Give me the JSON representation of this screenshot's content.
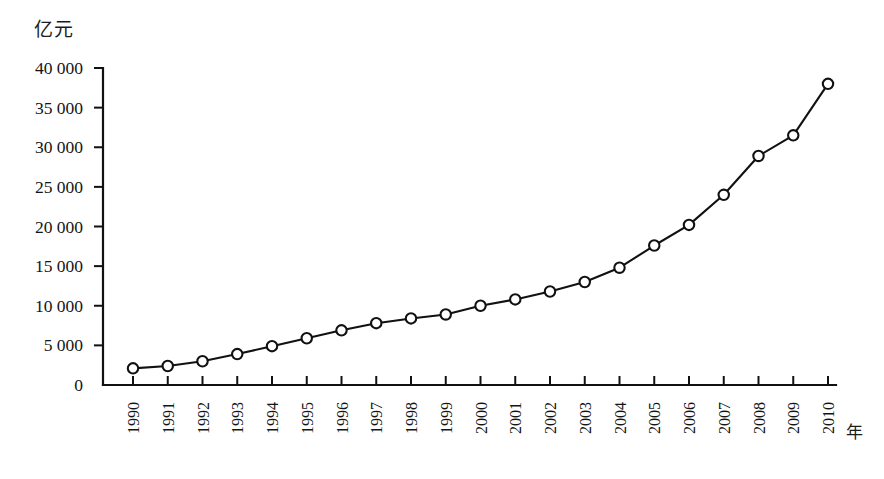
{
  "chart_data": {
    "type": "line",
    "title": "",
    "subtitle": "",
    "xlabel": "年",
    "ylabel": "亿元",
    "categories": [
      "1990",
      "1991",
      "1992",
      "1993",
      "1994",
      "1995",
      "1996",
      "1997",
      "1998",
      "1999",
      "2000",
      "2001",
      "2002",
      "2003",
      "2004",
      "2005",
      "2006",
      "2007",
      "2008",
      "2009",
      "2010"
    ],
    "values": [
      2100,
      2400,
      3000,
      3900,
      4900,
      5900,
      6900,
      7800,
      8400,
      8900,
      10000,
      10800,
      11800,
      13000,
      14800,
      17600,
      20200,
      24000,
      28900,
      31500,
      38000
    ],
    "series": [
      {
        "name": "",
        "values": [
          2100,
          2400,
          3000,
          3900,
          4900,
          5900,
          6900,
          7800,
          8400,
          8900,
          10000,
          10800,
          11800,
          13000,
          14800,
          17600,
          20200,
          24000,
          28900,
          31500,
          38000
        ]
      }
    ],
    "ylim": [
      0,
      40000
    ],
    "ytick_values": [
      0,
      5000,
      10000,
      15000,
      20000,
      25000,
      30000,
      35000,
      40000
    ],
    "ytick_labels": [
      "0",
      "5 000",
      "10 000",
      "15 000",
      "20 000",
      "25 000",
      "30 000",
      "35 000",
      "40 000"
    ],
    "grid": false,
    "legend": "none",
    "marker": "open-circle",
    "line_color": "#111111",
    "marker_fill": "#ffffff",
    "background": "#ffffff",
    "x_tick_label_rotation": -90
  },
  "axes": {
    "y_unit_label": "亿元",
    "x_unit_label": "年"
  }
}
